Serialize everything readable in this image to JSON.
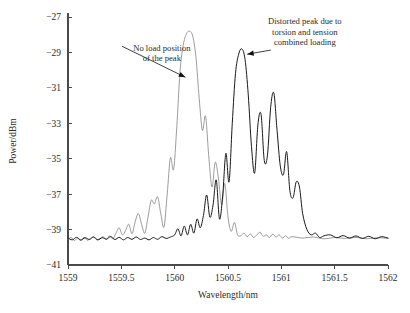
{
  "chart_data": {
    "type": "line",
    "title": "",
    "xlabel": "Wavelength/nm",
    "ylabel": "Power/dBm",
    "xlim": [
      1559,
      1562
    ],
    "ylim": [
      -41,
      -27
    ],
    "xticks": [
      1559,
      1559.5,
      1560,
      1560.5,
      1561,
      1561.5,
      1562
    ],
    "xticklabels": [
      "1559",
      "1559.5",
      "1560",
      "1560.5",
      "1561",
      "1561.5",
      "1562"
    ],
    "yticks": [
      -41,
      -39,
      -37,
      -35,
      -33,
      -31,
      -29,
      -27
    ],
    "yticklabels": [
      "-41",
      "-39",
      "-37",
      "-35",
      "-33",
      "-31",
      "-29",
      "-27"
    ],
    "grid": false,
    "legend": false,
    "noise_floor": -39.55,
    "series": [
      {
        "name": "no-load-spectrum",
        "color": "#8a8a8a",
        "linewidth": 0.85,
        "peak_wavelength": 1560.15,
        "peak_power": -27.8,
        "x": [
          1559.0,
          1559.03,
          1559.06,
          1559.09,
          1559.12,
          1559.15,
          1559.18,
          1559.21,
          1559.24,
          1559.27,
          1559.3,
          1559.33,
          1559.36,
          1559.39,
          1559.42,
          1559.45,
          1559.48,
          1559.51,
          1559.54,
          1559.57,
          1559.6,
          1559.63,
          1559.66,
          1559.69,
          1559.72,
          1559.75,
          1559.78,
          1559.81,
          1559.84,
          1559.87,
          1559.9,
          1559.93,
          1559.96,
          1559.99,
          1560.02,
          1560.05,
          1560.08,
          1560.11,
          1560.14,
          1560.17,
          1560.2,
          1560.23,
          1560.26,
          1560.29,
          1560.32,
          1560.35,
          1560.38,
          1560.41,
          1560.44,
          1560.47,
          1560.5,
          1560.53,
          1560.56,
          1560.59,
          1560.62,
          1560.65,
          1560.68,
          1560.71,
          1560.74,
          1560.77,
          1560.8,
          1560.83,
          1560.86,
          1560.89,
          1560.92,
          1560.95,
          1560.98,
          1561.01,
          1561.04,
          1561.07,
          1561.1,
          1561.2,
          1561.3,
          1561.4,
          1561.5,
          1561.6,
          1561.7,
          1561.8,
          1561.9,
          1562.0
        ],
        "y": [
          -39.55,
          -39.45,
          -39.62,
          -39.48,
          -39.58,
          -39.44,
          -39.6,
          -39.5,
          -39.42,
          -39.58,
          -39.5,
          -39.4,
          -39.56,
          -39.35,
          -39.52,
          -39.2,
          -38.9,
          -39.3,
          -39.05,
          -38.7,
          -39.25,
          -38.55,
          -38.1,
          -38.7,
          -39.2,
          -38.3,
          -37.35,
          -37.55,
          -37.15,
          -38.1,
          -38.85,
          -37.0,
          -34.95,
          -35.6,
          -33.2,
          -30.1,
          -28.6,
          -27.95,
          -27.8,
          -28.1,
          -29.3,
          -31.6,
          -33.4,
          -32.6,
          -34.9,
          -36.6,
          -35.2,
          -36.1,
          -37.6,
          -36.4,
          -38.3,
          -39.1,
          -38.6,
          -39.3,
          -39.35,
          -39.2,
          -39.4,
          -39.25,
          -39.45,
          -39.3,
          -39.15,
          -39.38,
          -39.3,
          -39.45,
          -39.25,
          -39.42,
          -39.3,
          -39.48,
          -39.35,
          -39.5,
          -39.4,
          -39.48,
          -39.42,
          -39.52,
          -39.45,
          -39.5,
          -39.44,
          -39.52,
          -39.46,
          -39.5
        ]
      },
      {
        "name": "torsion-tension-distorted-spectrum",
        "color": "#1a1a1a",
        "linewidth": 1.0,
        "peak_wavelength": 1560.63,
        "peak_power": -28.8,
        "x": [
          1559.0,
          1559.04,
          1559.08,
          1559.12,
          1559.16,
          1559.2,
          1559.24,
          1559.28,
          1559.32,
          1559.36,
          1559.4,
          1559.44,
          1559.48,
          1559.52,
          1559.56,
          1559.6,
          1559.64,
          1559.68,
          1559.72,
          1559.76,
          1559.8,
          1559.84,
          1559.88,
          1559.92,
          1559.96,
          1560.0,
          1560.03,
          1560.06,
          1560.09,
          1560.12,
          1560.15,
          1560.18,
          1560.21,
          1560.24,
          1560.27,
          1560.3,
          1560.33,
          1560.36,
          1560.39,
          1560.42,
          1560.45,
          1560.48,
          1560.51,
          1560.54,
          1560.57,
          1560.6,
          1560.63,
          1560.66,
          1560.69,
          1560.72,
          1560.75,
          1560.78,
          1560.81,
          1560.84,
          1560.87,
          1560.9,
          1560.93,
          1560.96,
          1560.99,
          1561.02,
          1561.05,
          1561.08,
          1561.11,
          1561.14,
          1561.17,
          1561.2,
          1561.24,
          1561.28,
          1561.32,
          1561.36,
          1561.4,
          1561.46,
          1561.52,
          1561.58,
          1561.64,
          1561.7,
          1561.76,
          1561.82,
          1561.88,
          1561.94,
          1562.0
        ],
        "y": [
          -39.48,
          -39.58,
          -39.44,
          -39.6,
          -39.46,
          -39.56,
          -39.42,
          -39.58,
          -39.46,
          -39.54,
          -39.4,
          -39.56,
          -39.44,
          -39.58,
          -39.45,
          -39.55,
          -39.42,
          -39.56,
          -39.48,
          -39.58,
          -39.45,
          -39.55,
          -39.4,
          -39.5,
          -39.42,
          -39.3,
          -38.95,
          -39.35,
          -38.8,
          -39.3,
          -38.7,
          -39.2,
          -38.4,
          -38.9,
          -38.2,
          -37.05,
          -38.3,
          -37.6,
          -36.2,
          -38.4,
          -37.1,
          -34.7,
          -36.3,
          -33.0,
          -30.2,
          -29.1,
          -28.8,
          -29.4,
          -31.4,
          -34.3,
          -35.8,
          -33.1,
          -32.5,
          -35.1,
          -34.8,
          -32.1,
          -31.3,
          -33.4,
          -35.4,
          -35.9,
          -34.6,
          -36.8,
          -37.2,
          -36.3,
          -36.6,
          -38.1,
          -39.0,
          -39.3,
          -39.2,
          -39.45,
          -39.35,
          -39.3,
          -39.46,
          -39.34,
          -39.48,
          -39.36,
          -39.5,
          -39.38,
          -39.52,
          -39.4,
          -39.48
        ]
      }
    ],
    "annotations": [
      {
        "id": "no-load-annotation",
        "lines": [
          "No load position",
          "of the peak"
        ],
        "text_x": 1559.88,
        "text_y": -28.9,
        "point_wavelength": 1560.1,
        "point_power": -30.4
      },
      {
        "id": "distorted-peak-annotation",
        "lines": [
          "Distorted peak due to",
          "torsion and tension",
          "combined loading"
        ],
        "text_x": 1561.22,
        "text_y": -27.4,
        "point_wavelength": 1560.68,
        "point_power": -29.1
      }
    ]
  }
}
